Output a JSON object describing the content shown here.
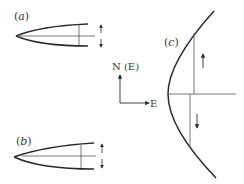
{
  "diagram": {
    "panels": [
      {
        "id": "a",
        "label": "(a)",
        "label_letter": "a",
        "shape": "narrow wedge (tapered lens) opening to the right",
        "markers": [
          "vertical section line",
          "horizontal center line",
          "double-headed arrow (up/down)"
        ]
      },
      {
        "id": "b",
        "label": "(b)",
        "label_letter": "b",
        "shape": "asymmetric wedge opening to the right",
        "markers": [
          "vertical section line",
          "horizontal center line",
          "double-headed arrow (up/down)"
        ]
      },
      {
        "id": "c",
        "label": "(c)",
        "label_letter": "c",
        "shape": "parabola opening to the right",
        "markers": [
          "horizontal axis line",
          "upper vertical line with up arrow",
          "lower vertical line with down arrow"
        ]
      }
    ],
    "compass": {
      "north_label": "N (E)",
      "east_label": "E"
    },
    "colors": {
      "stroke": "#2b2b2b",
      "thin_stroke": "#555555",
      "background": "#ffffff"
    }
  }
}
